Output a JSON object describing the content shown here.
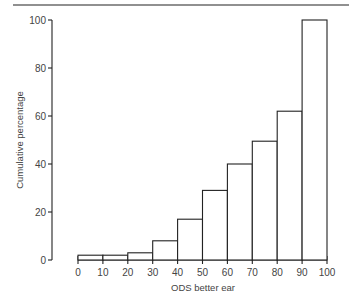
{
  "chart_data": {
    "type": "bar",
    "subtype": "histogram",
    "title": "",
    "xlabel": "ODS better ear",
    "ylabel": "Cumulative percentage",
    "x_ticks": [
      "0",
      "10",
      "20",
      "30",
      "40",
      "50",
      "60",
      "70",
      "80",
      "90",
      "100"
    ],
    "y_ticks": [
      "0",
      "20",
      "40",
      "60",
      "80",
      "100"
    ],
    "xlim": [
      0,
      100
    ],
    "ylim": [
      0,
      100
    ],
    "grid": false,
    "legend": null,
    "bins": [
      {
        "from": 0,
        "to": 10,
        "value": 2
      },
      {
        "from": 10,
        "to": 20,
        "value": 2
      },
      {
        "from": 20,
        "to": 30,
        "value": 3
      },
      {
        "from": 30,
        "to": 40,
        "value": 8
      },
      {
        "from": 40,
        "to": 50,
        "value": 17
      },
      {
        "from": 50,
        "to": 60,
        "value": 29
      },
      {
        "from": 60,
        "to": 70,
        "value": 40
      },
      {
        "from": 70,
        "to": 80,
        "value": 49.5
      },
      {
        "from": 80,
        "to": 90,
        "value": 62
      },
      {
        "from": 90,
        "to": 100,
        "value": 100
      }
    ],
    "categories": [
      "0-10",
      "10-20",
      "20-30",
      "30-40",
      "40-50",
      "50-60",
      "60-70",
      "70-80",
      "80-90",
      "90-100"
    ],
    "values": [
      2,
      2,
      3,
      8,
      17,
      29,
      40,
      49.5,
      62,
      100
    ]
  },
  "colors": {
    "line": "#222222",
    "text": "#444444",
    "fill": "#ffffff"
  }
}
